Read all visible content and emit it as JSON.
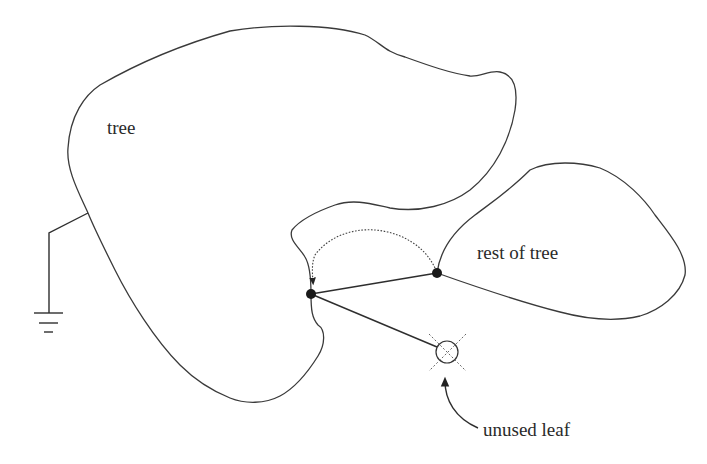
{
  "diagram": {
    "labels": {
      "tree": "tree",
      "rest_of_tree": "rest of tree",
      "unused_leaf": "unused leaf"
    },
    "nodes": [
      {
        "id": "attach-node",
        "x": 311,
        "y": 294
      },
      {
        "id": "rest-root-node",
        "x": 437,
        "y": 273
      }
    ],
    "unused_leaf": {
      "x": 447,
      "y": 352,
      "r": 11
    },
    "colors": {
      "stroke": "#3a3a3a",
      "node_fill": "#1a1a1a",
      "background": "#ffffff"
    }
  }
}
